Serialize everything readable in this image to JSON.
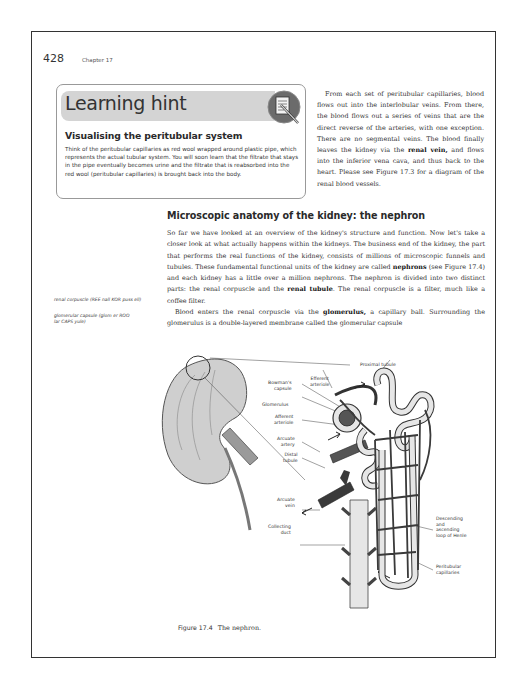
{
  "header": {
    "page_number": "428",
    "chapter": "Chapter 17"
  },
  "learning_hint": {
    "title": "Learning hint",
    "icon": "notepad-pencil-icon",
    "subtitle": "Visualising the peritubular system",
    "body": "Think of the peritubular capillaries as red wool wrapped around plastic pipe, which represents the actual tubular system. You will soon learn that the filtrate that stays in the pipe eventually becomes urine and the filtrate that is reabsorbed into the red wool (peritubular capillaries) is brought back into the body."
  },
  "right_column": {
    "p1_a": "From each set of peritubular capillaries, blood flows out into the interlobular veins. From there, the blood flows out a series of veins that are the direct reverse of the arteries, with one exception. There are no segmental veins. The blood finally leaves the kidney via the ",
    "p1_bold": "renal vein,",
    "p1_b": " and flows into the inferior vena cava, and thus back to the heart. Please see Figure 17.3 for a diagram of the renal blood vessels."
  },
  "section": {
    "heading": "Microscopic anatomy of the kidney: the nephron",
    "p1_a": "So far we have looked at an overview of the kidney's structure and function. Now let's take a closer look at what actually happens within the kidneys. The business end of the kidney, the part that performs the real functions of the kidney, consists of millions of microscopic funnels and tubules. These fundamental functional units of the kidney are called ",
    "p1_bold1": "nephrons",
    "p1_b": " (see Figure 17.4) and each kidney has a little over a million nephrons. The nephron is divided into two distinct parts: the renal corpuscle and the ",
    "p1_bold2": "renal tubule",
    "p1_c": ". The renal corpuscle is a filter, much like a coffee filter.",
    "p2_a": "Blood enters the renal corpuscle via the ",
    "p2_bold": "glomerulus,",
    "p2_b": " a capillary ball. Surrounding the glomerulus is a double-layered membrane called the glomerular capsule"
  },
  "margin_notes": [
    "renal corpuscle (REE nall KOR puss ell)",
    "glomerular capsule (glom er ROO lar CAPS yule)"
  ],
  "figure": {
    "labels": {
      "proximal_tubule": "Proximal tubule",
      "efferent_arteriole": "Efferent\narteriole",
      "bowmans_capsule": "Bowman's\ncapsule",
      "glomerulus": "Glomerulus",
      "afferent_arteriole": "Afferent\narteriole",
      "arcuate_artery": "Arcuate\nartery",
      "distal_tubule": "Distal\ntubule",
      "arcuate_vein": "Arcuate\nvein",
      "collecting_duct": "Collecting\nduct",
      "loop_of_henle": "Descending\nand\nascending\nloop of Henle",
      "peritubular_capillaries": "Peritubular\ncapillaries"
    },
    "caption_number": "Figure 17.4",
    "caption_text": "The nephron."
  },
  "colors": {
    "frame": "#333333",
    "hint_banner": "#d4d4d4",
    "icon_circle": "#6b6b6b",
    "vessel_dark": "#3a3a3a",
    "tubule_light": "#e6e6e6"
  }
}
